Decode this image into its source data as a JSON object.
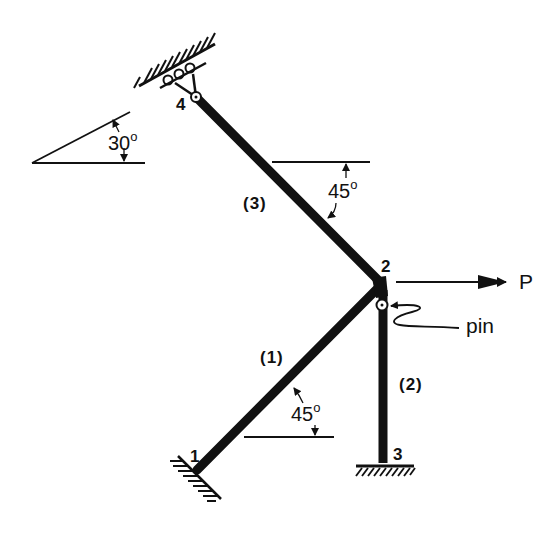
{
  "diagram": {
    "type": "plane frame / truss with supports",
    "nodes": [
      {
        "id": "1",
        "label": "1",
        "support": "fixed",
        "x": 197,
        "y": 470
      },
      {
        "id": "2",
        "label": "2",
        "support": "none",
        "x": 380,
        "y": 285
      },
      {
        "id": "3",
        "label": "3",
        "support": "fixed",
        "x": 383,
        "y": 462
      },
      {
        "id": "4",
        "label": "4",
        "support": "roller on 30° inclined surface",
        "x": 196,
        "y": 97
      }
    ],
    "members": [
      {
        "id": "1",
        "label": "(1)",
        "from": "1",
        "to": "2",
        "angle_label": "45",
        "angle_unit": "o"
      },
      {
        "id": "2",
        "label": "(2)",
        "from": "3",
        "to": "2"
      },
      {
        "id": "3",
        "label": "(3)",
        "from": "4",
        "to": "2",
        "angle_label": "45",
        "angle_unit": "o"
      }
    ],
    "load": {
      "label": "P",
      "direction": "right",
      "node": "2"
    },
    "pin": {
      "label": "pin",
      "location": "member 2 top, below node 2"
    },
    "support_incline": {
      "angle_label": "30",
      "angle_unit": "o"
    }
  },
  "colors": {
    "ink": "#111111",
    "background": "#ffffff"
  }
}
